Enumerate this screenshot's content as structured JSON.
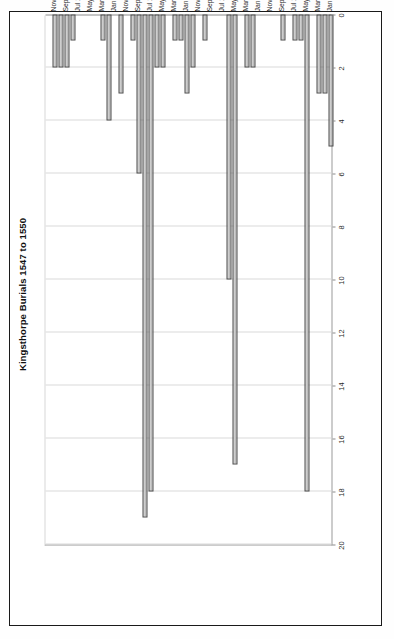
{
  "page": {
    "orientation": "rotated-90-ccw",
    "background": "#ffffff",
    "frame_color": "#1a1a1a"
  },
  "chart_data": {
    "type": "bar",
    "orientation": "horizontal",
    "title": "Kingsthorpe Burials 1547 to 1550",
    "xlabel": "",
    "ylabel": "",
    "xlim": [
      0,
      20
    ],
    "xticks": [
      0,
      2,
      4,
      6,
      8,
      10,
      12,
      14,
      16,
      18,
      20
    ],
    "grid": true,
    "legend": false,
    "bar_fill": "#c2c2c2",
    "bar_border": "#4a4a4a",
    "axis_color": "#8c8c8c",
    "grid_color": "#d9d9d9",
    "label_every_nth": 2,
    "categories": [
      "Jan 1547",
      "Feb 1547",
      "Mar 1547",
      "Apr 1547",
      "May 1547",
      "Jun 1547",
      "Jul 1547",
      "Aug 1547",
      "Sep 1547",
      "Oct 1547",
      "Nov 1547",
      "Dec 1547",
      "Jan 1548",
      "Feb 1548",
      "Mar 1548",
      "Apr 1548",
      "May 1548",
      "Jun 1548",
      "Jul 1548",
      "Aug 1548",
      "Sep 1548",
      "Oct 1548",
      "Nov 1548",
      "Dec 1548",
      "Jan 1549",
      "Feb 1549",
      "Mar 1549",
      "Apr 1549",
      "May 1549",
      "Jun 1549",
      "Jul 1549",
      "Aug 1549",
      "Sep 1549",
      "Oct 1549",
      "Nov 1549",
      "Dec 1549",
      "Jan 1550",
      "Feb 1550",
      "Mar 1550",
      "Apr 1550",
      "May 1550",
      "Jun 1550",
      "Jul 1550",
      "Aug 1550",
      "Sep 1550",
      "Oct 1550",
      "Nov 1550",
      "Dec 1550"
    ],
    "values": [
      5,
      3,
      3,
      0,
      18,
      1,
      1,
      0,
      1,
      0,
      0,
      0,
      0,
      2,
      2,
      0,
      17,
      10,
      0,
      0,
      0,
      1,
      0,
      2,
      3,
      1,
      1,
      0,
      2,
      2,
      18,
      19,
      6,
      1,
      0,
      3,
      0,
      4,
      1,
      0,
      0,
      0,
      0,
      1,
      2,
      2,
      2,
      0
    ],
    "visible_tick_labels": [
      "Jan 1547",
      "Mar 1547",
      "May 1547",
      "Jul 1547",
      "Sep 1547",
      "Nov 1547",
      "Jan 1548",
      "Mar 1548",
      "May 1548",
      "Jul 1548",
      "Sep 1548",
      "Nov 1548",
      "Jan 1549",
      "Mar 1549",
      "May 1549",
      "Jul 1549",
      "Sep 1549",
      "Nov 1549",
      "Jan 1550",
      "Mar 1550",
      "May 1550",
      "Jul 1550",
      "Sep 1550",
      "Nov 1550"
    ]
  }
}
